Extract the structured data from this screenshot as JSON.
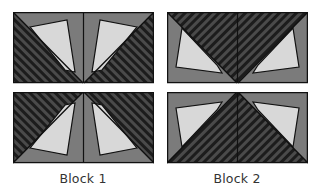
{
  "figure": {
    "blocks": [
      {
        "label": "Block 1",
        "description": "Two rows; dark striped triangles meet at center bottom (top row) and center top (bottom row), light quads in grey field"
      },
      {
        "label": "Block 2",
        "description": "Two rows; dark striped inverted triangle in top row, upright striped triangle in bottom row, light quads in grey corners"
      }
    ]
  },
  "colors": {
    "light": "#d8d8d8",
    "medium": "#7b7b7b",
    "stripe_dark": "#1c1c1c",
    "stripe_light": "#4a4a4a",
    "outline": "#111111"
  }
}
